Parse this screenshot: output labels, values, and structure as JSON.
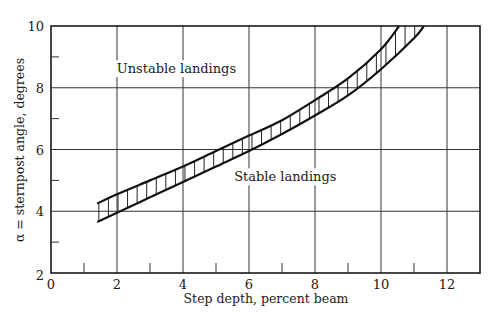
{
  "chart_data": {
    "type": "area",
    "title": "",
    "xlabel": "Step depth, percent beam",
    "ylabel": "α = sternpost angle, degrees",
    "xlim": [
      0,
      13
    ],
    "ylim": [
      2,
      10
    ],
    "x_ticks": [
      0,
      2,
      4,
      6,
      8,
      10,
      12
    ],
    "x_tick_labels": [
      "0",
      "2",
      "4",
      "6",
      "8",
      "10",
      "12"
    ],
    "x_minor_ticks": [
      1,
      3,
      5,
      7,
      9,
      11
    ],
    "y_ticks": [
      2,
      4,
      6,
      8,
      10
    ],
    "y_tick_labels": [
      "2",
      "4",
      "6",
      "8",
      "10"
    ],
    "y_minor_ticks": [
      3,
      5,
      7,
      9
    ],
    "grid": true,
    "legend": null,
    "series": [
      {
        "name": "Upper boundary",
        "x": [
          1.4,
          2,
          3,
          4,
          5,
          6,
          7,
          8,
          9,
          10,
          10.55
        ],
        "y": [
          4.25,
          4.55,
          5.0,
          5.45,
          5.95,
          6.45,
          6.95,
          7.6,
          8.3,
          9.25,
          10.0
        ]
      },
      {
        "name": "Lower boundary",
        "x": [
          1.4,
          2,
          3,
          4,
          5,
          6,
          7,
          8,
          9,
          10,
          11,
          11.3
        ],
        "y": [
          3.65,
          3.95,
          4.45,
          4.95,
          5.45,
          5.95,
          6.5,
          7.1,
          7.75,
          8.6,
          9.6,
          10.0
        ]
      }
    ],
    "band": "hatched region between upper and lower boundary (vertical hatching)",
    "annotations": [
      {
        "text": "Unstable landings",
        "x": 3.8,
        "y": 8.6
      },
      {
        "text": "Stable landings",
        "x": 7.1,
        "y": 5.1
      }
    ]
  },
  "labels": {
    "xlabel": "Step depth, percent beam",
    "ylabel": "α = sternpost angle, degrees",
    "unstable": "Unstable landings",
    "stable": "Stable landings",
    "x_ticks": [
      "0",
      "2",
      "4",
      "6",
      "8",
      "10",
      "12"
    ],
    "y_ticks": [
      "2",
      "4",
      "6",
      "8",
      "10"
    ]
  }
}
